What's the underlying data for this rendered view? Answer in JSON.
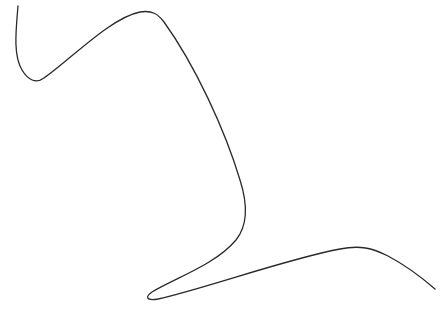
{
  "canvas": {
    "width": 445,
    "height": 311,
    "background": "#ffffff"
  },
  "curve": {
    "stroke_color": "#2a2a2a",
    "stroke_width": 1.3,
    "path": "M 18 6 C 16 30, 13 55, 22 70 C 28 80, 36 84, 44 78 C 70 60, 110 18, 140 12 C 152 10, 158 14, 164 22 C 195 65, 225 130, 240 180 C 248 205, 248 225, 236 240 C 215 265, 175 278, 152 292 C 145 297, 146 301, 158 299 C 200 290, 290 258, 340 249 C 360 245, 372 248, 388 256 C 405 265, 420 276, 435 289"
  }
}
